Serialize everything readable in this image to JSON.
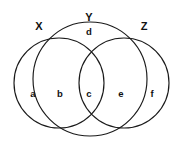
{
  "figure": {
    "kind": "venn-diagram-three-sets",
    "background_color": "#ffffff",
    "stroke_color": "#1a1a1a",
    "text_color": "#111111"
  },
  "set_labels": [
    {
      "text": "X",
      "x": 39,
      "y": 26
    },
    {
      "text": "Y",
      "x": 89,
      "y": 17
    },
    {
      "text": "Z",
      "x": 144,
      "y": 26
    }
  ],
  "region_labels": [
    {
      "text": "a",
      "x": 33,
      "y": 94
    },
    {
      "text": "b",
      "x": 60,
      "y": 94
    },
    {
      "text": "c",
      "x": 89,
      "y": 94
    },
    {
      "text": "d",
      "x": 89,
      "y": 32
    },
    {
      "text": "e",
      "x": 121,
      "y": 94
    },
    {
      "text": "f",
      "x": 152,
      "y": 94
    }
  ],
  "circles": [
    {
      "name": "X",
      "cx": 59,
      "cy": 83,
      "r": 45
    },
    {
      "name": "Y",
      "cx": 90,
      "cy": 79,
      "r": 57
    },
    {
      "name": "Z",
      "cx": 124,
      "cy": 83,
      "r": 45
    }
  ]
}
